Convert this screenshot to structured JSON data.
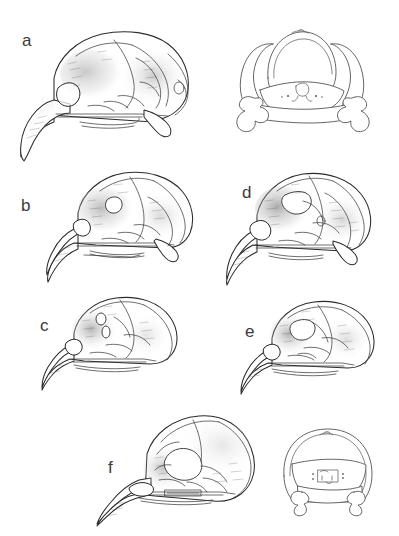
{
  "figure": {
    "type": "scientific-illustration-plate",
    "background_color": "#ffffff",
    "ink_color": "#2b2b2b",
    "label_color": "#3a3a3a",
    "width": 399,
    "height": 536
  },
  "panels": [
    {
      "id": "a",
      "label": "a",
      "view": "lateral",
      "description": "largest skull, lateral view, long decurved hooked bill",
      "label_x": 22,
      "label_y": 32,
      "box": {
        "x": 18,
        "y": 18,
        "w": 190,
        "h": 152
      }
    },
    {
      "id": "a-caudal",
      "label": "",
      "view": "caudal",
      "description": "posterior view of skull with paired quadrate bones",
      "label_x": 0,
      "label_y": 0,
      "box": {
        "x": 218,
        "y": 18,
        "w": 166,
        "h": 128
      }
    },
    {
      "id": "b",
      "label": "b",
      "view": "lateral",
      "description": "medium skull, lateral view, hooked bill and open orbit",
      "label_x": 21,
      "label_y": 197,
      "box": {
        "x": 44,
        "y": 163,
        "w": 160,
        "h": 124
      }
    },
    {
      "id": "d",
      "label": "d",
      "view": "lateral",
      "description": "medium skull, lateral view, shaded temporal region",
      "label_x": 242,
      "label_y": 184,
      "box": {
        "x": 225,
        "y": 163,
        "w": 160,
        "h": 128
      }
    },
    {
      "id": "c",
      "label": "c",
      "view": "lateral",
      "description": "smaller rounded skull, lateral view, slender bill",
      "label_x": 40,
      "label_y": 317,
      "box": {
        "x": 40,
        "y": 287,
        "w": 150,
        "h": 104
      }
    },
    {
      "id": "e",
      "label": "e",
      "view": "lateral",
      "description": "smaller rounded skull, lateral view, slender bill",
      "label_x": 245,
      "label_y": 323,
      "box": {
        "x": 240,
        "y": 292,
        "w": 148,
        "h": 102
      }
    },
    {
      "id": "f",
      "label": "f",
      "view": "lateral",
      "description": "skull with large rounded braincase and big orbit, long slender bill",
      "label_x": 108,
      "label_y": 459,
      "box": {
        "x": 95,
        "y": 408,
        "w": 170,
        "h": 120
      }
    },
    {
      "id": "f-caudal",
      "label": "",
      "view": "caudal",
      "description": "posterior view of skull, rounded braincase outline",
      "label_x": 0,
      "label_y": 0,
      "box": {
        "x": 276,
        "y": 420,
        "w": 104,
        "h": 96
      }
    }
  ],
  "labels": [
    "a",
    "b",
    "c",
    "d",
    "e",
    "f"
  ]
}
